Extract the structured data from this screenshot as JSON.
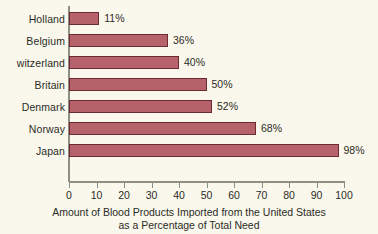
{
  "chart_data": {
    "type": "bar",
    "orientation": "horizontal",
    "title": "",
    "xlabel_line1": "Amount of Blood Products Imported from the United States",
    "xlabel_line2": "as a Percentage of Total Need",
    "ylabel": "",
    "categories": [
      "Holland",
      "Belgium",
      "witzerland",
      "Britain",
      "Denmark",
      "Norway",
      "Japan"
    ],
    "values": [
      11,
      36,
      40,
      50,
      52,
      68,
      98
    ],
    "value_labels": [
      "11%",
      "36%",
      "40%",
      "50%",
      "52%",
      "68%",
      "98%"
    ],
    "xlim": [
      0,
      100
    ],
    "xticks": [
      0,
      10,
      20,
      30,
      40,
      50,
      60,
      70,
      80,
      90,
      100
    ],
    "xtick_labels": [
      "0",
      "10",
      "20",
      "30",
      "40",
      "50",
      "60",
      "70",
      "80",
      "90",
      "100"
    ],
    "grid": false,
    "legend": null,
    "colors": {
      "bar_fill": "#b5626b",
      "bar_outline": "#6e2a33",
      "background": "#faf8ec",
      "axis": "#8d8f84",
      "text": "#2b2b26"
    }
  }
}
